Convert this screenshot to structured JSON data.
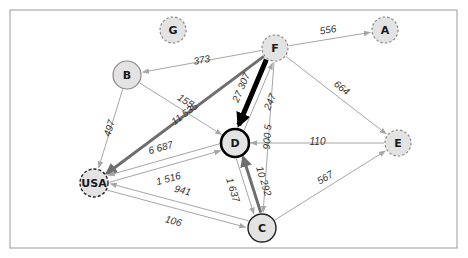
{
  "diagram": {
    "type": "directed-weighted-network",
    "colors": {
      "node_fill": "#e3e3e3",
      "light_edge": "#a6a6a6",
      "medium_edge": "#6e6e6e",
      "heavy_edge": "#000000",
      "frame": "#9a9a9a"
    },
    "nodes": [
      {
        "id": "G",
        "label": "G",
        "x": 173,
        "y": 30,
        "r": 13,
        "border": "dashed-light"
      },
      {
        "id": "A",
        "label": "A",
        "x": 385,
        "y": 30,
        "r": 13,
        "border": "dashed-light"
      },
      {
        "id": "F",
        "label": "F",
        "x": 275,
        "y": 48,
        "r": 13,
        "border": "dashed-light"
      },
      {
        "id": "B",
        "label": "B",
        "x": 127,
        "y": 75,
        "r": 14,
        "border": "solid-light"
      },
      {
        "id": "D",
        "label": "D",
        "x": 235,
        "y": 143,
        "r": 14,
        "border": "solid-thick-black"
      },
      {
        "id": "E",
        "label": "E",
        "x": 398,
        "y": 143,
        "r": 13,
        "border": "dashed-light"
      },
      {
        "id": "USA",
        "label": "USA",
        "x": 94,
        "y": 183,
        "r": 14,
        "border": "dashed-dark"
      },
      {
        "id": "C",
        "label": "C",
        "x": 262,
        "y": 228,
        "r": 14,
        "border": "solid-dark"
      }
    ],
    "edges": [
      {
        "from": "F",
        "to": "B",
        "label": "373",
        "weight": "light"
      },
      {
        "from": "F",
        "to": "A",
        "label": "556",
        "weight": "light"
      },
      {
        "from": "F",
        "to": "E",
        "label": "664",
        "weight": "light"
      },
      {
        "from": "F",
        "to": "USA",
        "label": "11 535",
        "weight": "medium"
      },
      {
        "from": "F",
        "to": "D",
        "label": "27 307",
        "weight": "heavy"
      },
      {
        "from": "D",
        "to": "F",
        "label": "247",
        "weight": "light"
      },
      {
        "from": "F",
        "to": "C",
        "label": "900 5",
        "weight": "light"
      },
      {
        "from": "B",
        "to": "D",
        "label": "155",
        "weight": "light"
      },
      {
        "from": "B",
        "to": "USA",
        "label": "497",
        "weight": "light"
      },
      {
        "from": "USA",
        "to": "D",
        "label": "1 516",
        "weight": "light"
      },
      {
        "from": "D",
        "to": "USA",
        "label": "6 687",
        "weight": "light"
      },
      {
        "from": "E",
        "to": "D",
        "label": "110",
        "weight": "light"
      },
      {
        "from": "D",
        "to": "C",
        "label": "1 637",
        "weight": "light"
      },
      {
        "from": "C",
        "to": "D",
        "label": "10 292",
        "weight": "medium"
      },
      {
        "from": "USA",
        "to": "C",
        "label": "106",
        "weight": "light"
      },
      {
        "from": "C",
        "to": "USA",
        "label": "941",
        "weight": "light"
      },
      {
        "from": "C",
        "to": "E",
        "label": "567",
        "weight": "light"
      }
    ]
  },
  "caption": {
    "text": ""
  }
}
